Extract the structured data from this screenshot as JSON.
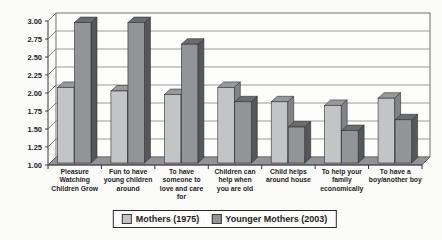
{
  "chart_data": {
    "type": "bar",
    "style": "3d-column",
    "title": "",
    "categories": [
      "Pleasure\nWatching\nChildren Grow",
      "Fun to have\nyoung children\naround",
      "To have\nsomeone to\nlove and care\nfor",
      "Children can\nhelp when\nyou are old",
      "Child helps\naround house",
      "To help your\nfamily\neconomically",
      "To have a\nboy/another boy"
    ],
    "series": [
      {
        "name": "Mothers (1975)",
        "values": [
          2.05,
          2.0,
          1.95,
          2.05,
          1.85,
          1.8,
          1.9
        ],
        "color": "#c3c4c6",
        "color_side": "#828386",
        "color_top": "#98999c"
      },
      {
        "name": "Younger Mothers (2003)",
        "values": [
          2.95,
          2.95,
          2.65,
          1.85,
          1.5,
          1.45,
          1.6
        ],
        "color": "#939497",
        "color_side": "#56575a",
        "color_top": "#6b6c6f"
      }
    ],
    "ylim": [
      1.0,
      3.0
    ],
    "ytick_step": 0.25,
    "ytick_labels": [
      "1.00",
      "1.25",
      "1.50",
      "1.75",
      "2.00",
      "2.25",
      "2.50",
      "2.75",
      "3.00"
    ],
    "grid": true,
    "legend_position": "bottom",
    "colors": {
      "gridline": "#818182",
      "axis": "#38383a",
      "wall_border": "#636365",
      "floor": "#929396",
      "text": "#1d1d1d",
      "background": "#fbfbfa"
    }
  },
  "legend": {
    "items": [
      {
        "label": "Mothers (1975)",
        "color": "#c3c4c6"
      },
      {
        "label": "Younger Mothers (2003)",
        "color": "#939497"
      }
    ]
  }
}
